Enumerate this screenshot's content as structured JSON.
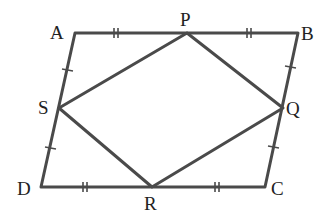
{
  "diagram": {
    "stroke_color": "#4a4a4a",
    "points": {
      "A": {
        "label": "A",
        "x": 75,
        "y": 33
      },
      "B": {
        "label": "B",
        "x": 298,
        "y": 33
      },
      "C": {
        "label": "C",
        "x": 265,
        "y": 187
      },
      "D": {
        "label": "D",
        "x": 41,
        "y": 187
      },
      "P": {
        "label": "P",
        "x": 187,
        "y": 33
      },
      "Q": {
        "label": "Q",
        "x": 283,
        "y": 108
      },
      "R": {
        "label": "R",
        "x": 152,
        "y": 187
      },
      "S": {
        "label": "S",
        "x": 59,
        "y": 108
      }
    },
    "outer_shape": [
      "A",
      "B",
      "C",
      "D"
    ],
    "inner_shape": [
      "P",
      "Q",
      "R",
      "S"
    ],
    "equal_marks": {
      "single": [
        "AS",
        "SD",
        "BQ",
        "QC"
      ],
      "double": [
        "AP",
        "PB",
        "DR",
        "RC"
      ]
    }
  }
}
